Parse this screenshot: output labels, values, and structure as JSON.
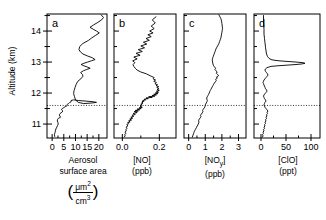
{
  "figure": {
    "yaxis": {
      "label": "Altitude (km)",
      "ticks": [
        11,
        12,
        13,
        14
      ],
      "range": [
        10.55,
        14.55
      ]
    },
    "reference_line_km": 11.6
  },
  "chart_data": [
    {
      "type": "line",
      "panel": "a",
      "title": "",
      "xlabel_line1": "Aerosol",
      "xlabel_line2": "surface area",
      "unit_numerator": "μm",
      "unit_num_exp": "2",
      "unit_denominator": "cm",
      "unit_den_exp": "3",
      "ylabel": "Altitude (km)",
      "xticks": [
        0,
        5,
        10,
        15,
        20
      ],
      "xlim": [
        -2.2,
        23.5
      ],
      "ylim": [
        10.55,
        14.55
      ],
      "grid": false,
      "legend": "none",
      "x": [
        1.1,
        1.0,
        1.2,
        1.4,
        1.6,
        2.0,
        2.3,
        2.6,
        2.5,
        2.2,
        2.3,
        2.6,
        3.6,
        3.3,
        3.1,
        3.4,
        4.2,
        4.6,
        4.0,
        4.3,
        5.0,
        5.6,
        6.2,
        6.5,
        6.3,
        6.6,
        7.0,
        7.4,
        7.6,
        8.2,
        8.0,
        8.1,
        9.2,
        11.2,
        14.5,
        17.6,
        19.0,
        17.0,
        13.5,
        11.2,
        10.0,
        9.6,
        9.2,
        9.4,
        9.8,
        10.3,
        11.0,
        12.3,
        13.2,
        13.0,
        12.2,
        13.4,
        14.8,
        16.3,
        15.0,
        13.6,
        12.4,
        13.6,
        15.2,
        16.8,
        18.4,
        17.2,
        15.0,
        13.2,
        12.2,
        11.5,
        11.8,
        13.2,
        15.6,
        17.0,
        18.6,
        20.2,
        19.0,
        17.6,
        16.2,
        17.8,
        19.6,
        21.2,
        22.0,
        21.0
      ],
      "y": [
        10.6,
        10.66,
        10.72,
        10.78,
        10.84,
        10.9,
        10.95,
        11.0,
        11.05,
        11.1,
        11.14,
        11.18,
        11.22,
        11.26,
        11.3,
        11.34,
        11.38,
        11.42,
        11.46,
        11.5,
        11.53,
        11.56,
        11.58,
        11.6,
        11.62,
        11.64,
        11.66,
        11.68,
        11.7,
        11.72,
        11.74,
        11.76,
        11.78,
        11.76,
        11.74,
        11.72,
        11.7,
        11.68,
        11.66,
        11.7,
        11.78,
        11.88,
        11.98,
        12.08,
        12.18,
        12.28,
        12.38,
        12.46,
        12.54,
        12.6,
        12.66,
        12.72,
        12.76,
        12.8,
        12.84,
        12.88,
        12.92,
        12.96,
        13.0,
        13.04,
        13.08,
        13.14,
        13.2,
        13.26,
        13.32,
        13.4,
        13.5,
        13.6,
        13.7,
        13.78,
        13.86,
        13.94,
        14.0,
        14.06,
        14.12,
        14.2,
        14.28,
        14.36,
        14.44,
        14.52
      ]
    },
    {
      "type": "line",
      "panel": "b",
      "title": "",
      "xlabel_line1": "[NO]",
      "xlabel_line2": "(ppb)",
      "xticks": [
        0.0,
        0.2
      ],
      "xticklabels": [
        "0.0",
        "0.2"
      ],
      "xlim": [
        -0.045,
        0.29
      ],
      "ylim": [
        10.55,
        14.55
      ],
      "grid": false,
      "legend": "none",
      "x": [
        0.01,
        0.016,
        0.012,
        0.02,
        0.014,
        0.022,
        0.018,
        0.026,
        0.02,
        0.03,
        0.024,
        0.034,
        0.028,
        0.042,
        0.034,
        0.05,
        0.04,
        0.056,
        0.046,
        0.062,
        0.052,
        0.07,
        0.058,
        0.08,
        0.064,
        0.086,
        0.07,
        0.094,
        0.08,
        0.102,
        0.09,
        0.108,
        0.096,
        0.104,
        0.098,
        0.106,
        0.1,
        0.11,
        0.104,
        0.112,
        0.106,
        0.118,
        0.11,
        0.126,
        0.118,
        0.14,
        0.128,
        0.162,
        0.142,
        0.176,
        0.16,
        0.184,
        0.17,
        0.192,
        0.178,
        0.196,
        0.184,
        0.2,
        0.188,
        0.198,
        0.186,
        0.196,
        0.182,
        0.19,
        0.176,
        0.184,
        0.17,
        0.18,
        0.166,
        0.172,
        0.15,
        0.13,
        0.1,
        0.08,
        0.07,
        0.062,
        0.058,
        0.068,
        0.056,
        0.08,
        0.062,
        0.096,
        0.074,
        0.108,
        0.086,
        0.12,
        0.1,
        0.132,
        0.114,
        0.146,
        0.128,
        0.156,
        0.138,
        0.166,
        0.148,
        0.172,
        0.156,
        0.178,
        0.162,
        0.182
      ],
      "y": [
        10.58,
        10.62,
        10.66,
        10.7,
        10.74,
        10.78,
        10.82,
        10.86,
        10.9,
        10.94,
        10.98,
        11.01,
        11.04,
        11.07,
        11.1,
        11.13,
        11.16,
        11.19,
        11.22,
        11.25,
        11.28,
        11.31,
        11.34,
        11.37,
        11.4,
        11.42,
        11.44,
        11.46,
        11.48,
        11.5,
        11.52,
        11.54,
        11.56,
        11.58,
        11.6,
        11.62,
        11.64,
        11.66,
        11.68,
        11.7,
        11.72,
        11.74,
        11.76,
        11.78,
        11.8,
        11.82,
        11.84,
        11.86,
        11.88,
        11.9,
        11.92,
        11.94,
        11.96,
        11.98,
        12.0,
        12.03,
        12.06,
        12.09,
        12.12,
        12.15,
        12.18,
        12.21,
        12.24,
        12.27,
        12.3,
        12.34,
        12.38,
        12.42,
        12.46,
        12.5,
        12.56,
        12.62,
        12.68,
        12.74,
        12.8,
        12.86,
        12.92,
        12.98,
        13.04,
        13.1,
        13.16,
        13.22,
        13.28,
        13.34,
        13.4,
        13.46,
        13.52,
        13.58,
        13.64,
        13.7,
        13.76,
        13.82,
        13.88,
        13.94,
        14.0,
        14.08,
        14.16,
        14.26,
        14.36,
        14.46
      ]
    },
    {
      "type": "line",
      "panel": "c",
      "title": "",
      "xlabel_line1": "[NO",
      "xlabel_sub": "y",
      "xlabel_line1b": "]",
      "xlabel_line2": "(ppb)",
      "xticks": [
        0,
        1,
        2,
        3
      ],
      "xlim": [
        -0.28,
        3.45
      ],
      "ylim": [
        10.55,
        14.55
      ],
      "grid": false,
      "legend": "none",
      "x": [
        0.22,
        0.26,
        0.3,
        0.34,
        0.4,
        0.46,
        0.52,
        0.58,
        0.62,
        0.6,
        0.64,
        0.7,
        0.74,
        0.72,
        0.76,
        0.82,
        0.86,
        0.84,
        0.88,
        0.94,
        0.98,
        1.0,
        1.02,
        1.06,
        1.1,
        1.12,
        1.1,
        1.08,
        1.12,
        1.16,
        1.2,
        1.24,
        1.26,
        1.3,
        1.34,
        1.38,
        1.42,
        1.46,
        1.5,
        1.54,
        1.6,
        1.66,
        1.62,
        1.72,
        1.68,
        1.8,
        1.74,
        1.66,
        1.72,
        1.64,
        1.58,
        1.62,
        1.56,
        1.5,
        1.46,
        1.44,
        1.42,
        1.44,
        1.48,
        1.52,
        1.56,
        1.6,
        1.64,
        1.7,
        1.76,
        1.82,
        1.86,
        1.9,
        1.94,
        1.96,
        1.98,
        2.0,
        2.02,
        2.04,
        2.02,
        2.0,
        1.98,
        1.94,
        1.88,
        1.82
      ],
      "y": [
        10.58,
        10.64,
        10.7,
        10.76,
        10.82,
        10.88,
        10.94,
        11.0,
        11.06,
        11.12,
        11.16,
        11.2,
        11.24,
        11.28,
        11.32,
        11.36,
        11.4,
        11.44,
        11.48,
        11.52,
        11.56,
        11.6,
        11.64,
        11.68,
        11.72,
        11.76,
        11.8,
        11.84,
        11.88,
        11.92,
        11.96,
        12.0,
        12.04,
        12.08,
        12.12,
        12.16,
        12.2,
        12.24,
        12.28,
        12.32,
        12.36,
        12.4,
        12.44,
        12.48,
        12.52,
        12.56,
        12.6,
        12.64,
        12.68,
        12.72,
        12.76,
        12.8,
        12.84,
        12.88,
        12.94,
        13.0,
        13.06,
        13.12,
        13.18,
        13.24,
        13.3,
        13.36,
        13.42,
        13.48,
        13.54,
        13.6,
        13.66,
        13.72,
        13.78,
        13.84,
        13.9,
        13.96,
        14.02,
        14.08,
        14.16,
        14.24,
        14.32,
        14.4,
        14.46,
        14.52
      ]
    },
    {
      "type": "line",
      "panel": "d",
      "title": "",
      "xlabel_line1": "[ClO]",
      "xlabel_line2": "(ppt)",
      "xticks": [
        0,
        50,
        100
      ],
      "xlim": [
        -14,
        118
      ],
      "ylim": [
        10.55,
        14.55
      ],
      "grid": false,
      "legend": "none",
      "x": [
        3,
        4,
        3,
        5,
        4,
        6,
        5,
        7,
        6,
        8,
        7,
        9,
        8,
        10,
        9,
        11,
        10,
        12,
        11,
        13,
        12,
        14,
        12,
        10,
        8,
        7,
        6,
        7,
        8,
        10,
        9,
        7,
        6,
        5,
        6,
        8,
        10,
        12,
        11,
        9,
        8,
        7,
        6,
        5,
        4,
        5,
        6,
        8,
        10,
        12,
        14,
        13,
        11,
        9,
        8,
        9,
        12,
        20,
        34,
        52,
        70,
        82,
        88,
        84,
        70,
        52,
        36,
        26,
        20,
        16,
        13,
        11,
        10,
        9,
        8,
        7,
        6,
        6,
        5,
        5
      ],
      "y": [
        10.58,
        10.62,
        10.66,
        10.7,
        10.74,
        10.78,
        10.82,
        10.86,
        10.9,
        10.94,
        10.98,
        11.02,
        11.06,
        11.1,
        11.14,
        11.18,
        11.22,
        11.26,
        11.3,
        11.34,
        11.38,
        11.42,
        11.46,
        11.5,
        11.54,
        11.58,
        11.62,
        11.66,
        11.7,
        11.74,
        11.78,
        11.82,
        11.86,
        11.9,
        11.94,
        11.98,
        12.02,
        12.06,
        12.1,
        12.14,
        12.18,
        12.22,
        12.26,
        12.3,
        12.34,
        12.38,
        12.42,
        12.46,
        12.5,
        12.54,
        12.58,
        12.62,
        12.66,
        12.7,
        12.74,
        12.78,
        12.82,
        12.86,
        12.88,
        12.9,
        12.92,
        12.94,
        12.96,
        12.98,
        13.0,
        13.02,
        13.04,
        13.06,
        13.08,
        13.12,
        13.18,
        13.26,
        13.36,
        13.48,
        13.62,
        13.76,
        13.9,
        14.06,
        14.26,
        14.5
      ]
    }
  ],
  "panel_labels": {
    "a": "a",
    "b": "b",
    "c": "c",
    "d": "d"
  }
}
